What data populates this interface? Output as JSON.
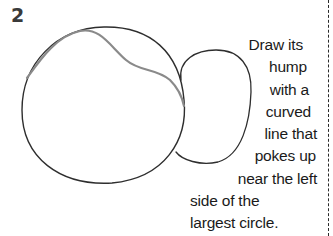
{
  "step": {
    "number": "2"
  },
  "instruction": {
    "lines": [
      "Draw its",
      "hump",
      "with a",
      "curved",
      "line that",
      "pokes up",
      "near the left",
      "side of the",
      "largest circle."
    ]
  },
  "drawing": {
    "shapes": [
      "large-circle",
      "hump-curve",
      "small-oval"
    ],
    "colors": {
      "outline": "#2e2e2e",
      "hump_curve": "#8a8a8a",
      "dashed_border": "#2a2a2a"
    }
  }
}
